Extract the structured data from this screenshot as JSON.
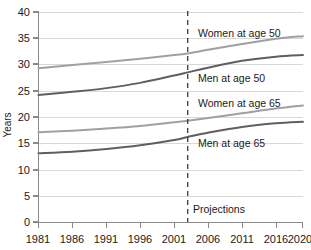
{
  "chart_data": {
    "type": "line",
    "title": "",
    "subtitle": "",
    "xlabel": "",
    "ylabel": "Years",
    "xlim": [
      1981,
      2020
    ],
    "ylim": [
      0,
      40
    ],
    "grid": true,
    "legend_position": "inline-right",
    "x_ticks": [
      "1981",
      "1986",
      "1991",
      "1996",
      "2001",
      "2006",
      "2011",
      "2016",
      "2020"
    ],
    "x_tick_values": [
      1981,
      1986,
      1991,
      1996,
      2001,
      2006,
      2011,
      2016,
      2020
    ],
    "y_ticks": [
      "0",
      "5",
      "10",
      "15",
      "20",
      "25",
      "30",
      "35",
      "40"
    ],
    "y_tick_values": [
      0,
      5,
      10,
      15,
      20,
      25,
      30,
      35,
      40
    ],
    "x": [
      1981,
      1986,
      1991,
      1996,
      2001,
      2003,
      2006,
      2011,
      2016,
      2020
    ],
    "series": [
      {
        "name": "Women at age 50",
        "label": "Women at age 50",
        "color": "#a0a0a0",
        "values": [
          29.3,
          29.9,
          30.5,
          31.1,
          31.8,
          32.1,
          32.8,
          33.9,
          34.9,
          35.4
        ]
      },
      {
        "name": "Men at age 50",
        "label": "Men at age 50",
        "color": "#5f5f5f",
        "values": [
          24.2,
          24.8,
          25.5,
          26.5,
          27.9,
          28.5,
          29.4,
          30.7,
          31.5,
          31.8
        ]
      },
      {
        "name": "Women at age 65",
        "label": "Women at age 65",
        "color": "#a0a0a0",
        "values": [
          17.1,
          17.4,
          17.8,
          18.3,
          19.0,
          19.3,
          19.8,
          20.7,
          21.6,
          22.2
        ]
      },
      {
        "name": "Men at age 65",
        "label": "Men at age 65",
        "color": "#5f5f5f",
        "values": [
          13.1,
          13.4,
          13.9,
          14.6,
          15.6,
          16.2,
          17.0,
          18.1,
          18.8,
          19.1
        ]
      }
    ],
    "annotations": [
      {
        "name": "projections-divider",
        "type": "vline",
        "x": 2003,
        "style": "dashed",
        "label": "Projections"
      }
    ]
  }
}
